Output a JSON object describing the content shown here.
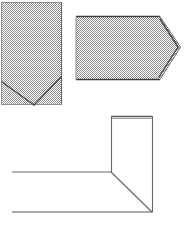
{
  "document": {
    "title": "Folding diagram sheet",
    "background_color": "#ffffff",
    "width": 191,
    "height": 229
  },
  "style": {
    "fill_pattern": "dither-checker-gray",
    "fill_color_light": "#ffffff",
    "fill_color_dark": "#9a9a9a",
    "fill_average": "#b9b9b9",
    "stroke_color": "#4a4a4a",
    "stroke_color_dark": "#3a3a3a",
    "stroke_color_light": "#6f6f6f",
    "stroke_width": 1
  },
  "figures": [
    {
      "id": "figure-1",
      "name": "filled-rectangle-with-v-fold",
      "shape": "rectangle",
      "filled": true,
      "outline": [
        [
          1,
          2
        ],
        [
          62,
          2
        ],
        [
          62,
          105
        ],
        [
          1,
          105
        ]
      ],
      "fold_lines": [
        {
          "name": "v-fold-left",
          "points": [
            [
              2,
              82
            ],
            [
              34,
              105
            ]
          ]
        },
        {
          "name": "v-fold-right",
          "points": [
            [
              34,
              105
            ],
            [
              61,
              77
            ]
          ]
        }
      ],
      "bounds": {
        "x": 1,
        "y": 2,
        "width": 61,
        "height": 103
      }
    },
    {
      "id": "figure-2",
      "name": "filled-pentagon-arrow-right",
      "shape": "pentagon",
      "filled": true,
      "outline": [
        [
          76,
          16
        ],
        [
          160,
          16
        ],
        [
          181,
          47
        ],
        [
          160,
          80
        ],
        [
          76,
          80
        ]
      ],
      "fold_lines": [
        {
          "name": "bevel-fold-top",
          "points": [
            [
              160,
              19
            ],
            [
              178,
              47
            ]
          ]
        },
        {
          "name": "bevel-fold-bottom",
          "points": [
            [
              178,
              47
            ],
            [
              159,
              77
            ]
          ]
        }
      ],
      "bounds": {
        "x": 76,
        "y": 16,
        "width": 105,
        "height": 64
      }
    },
    {
      "id": "figure-3",
      "name": "outline-corner-fold-assembly",
      "shape": "polyline-outline",
      "filled": false,
      "parts": [
        {
          "name": "vertical-panel-top-edge",
          "points": [
            [
              111,
              116
            ],
            [
              152,
              116
            ]
          ]
        },
        {
          "name": "vertical-panel-top-edge-shadow",
          "points": [
            [
              112,
              118
            ],
            [
              153,
              118
            ]
          ]
        },
        {
          "name": "vertical-panel-left-edge",
          "points": [
            [
              111,
              116
            ],
            [
              111,
              172
            ]
          ]
        },
        {
          "name": "vertical-panel-right-edge",
          "points": [
            [
              152,
              116
            ],
            [
              152,
              212
            ]
          ]
        },
        {
          "name": "diagonal-fold",
          "points": [
            [
              111,
              172
            ],
            [
              152,
              212
            ]
          ]
        },
        {
          "name": "upper-horizontal-line",
          "points": [
            [
              12,
              172
            ],
            [
              111,
              172
            ]
          ]
        },
        {
          "name": "lower-horizontal-line",
          "points": [
            [
              12,
              212
            ],
            [
              152,
              212
            ]
          ]
        }
      ],
      "bounds": {
        "x": 12,
        "y": 116,
        "width": 140,
        "height": 96
      }
    }
  ],
  "labels": {
    "figure_1_label": "",
    "figure_2_label": "",
    "figure_3_label": ""
  }
}
